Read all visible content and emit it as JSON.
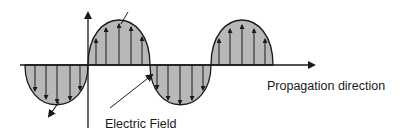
{
  "diagram": {
    "labels": {
      "propagation": "Propagation direction",
      "electric_field": "Electric Field"
    },
    "colors": {
      "fill": "#b8b8b8",
      "stroke": "#1a1a1a",
      "background": "#ffffff"
    },
    "lobes": [
      {
        "direction": "down",
        "x_start": 25,
        "x_end": 88
      },
      {
        "direction": "up",
        "x_start": 88,
        "x_end": 150
      },
      {
        "direction": "down",
        "x_start": 150,
        "x_end": 211
      },
      {
        "direction": "up",
        "x_start": 211,
        "x_end": 273
      }
    ]
  }
}
